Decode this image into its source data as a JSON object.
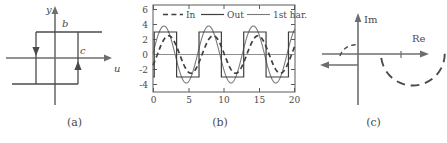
{
  "figure": {
    "panels": [
      {
        "id": "a",
        "caption": "(a)",
        "type": "hysteresis-relay-characteristic",
        "axis_labels": {
          "x": "u",
          "y": "y"
        },
        "point_labels": [
          "b",
          "c"
        ],
        "loop": {
          "x_switch_low": -1.0,
          "x_switch_high": 1.0,
          "y_high": 1.0,
          "y_low": -1.0,
          "direction": "clockwise"
        }
      },
      {
        "id": "b",
        "caption": "(b)",
        "type": "time-waveforms"
      },
      {
        "id": "c",
        "caption": "(c)",
        "type": "complex-plane-nyquist",
        "axis_labels": {
          "x": "Re",
          "y": "Im"
        },
        "arc": {
          "style": "dashed",
          "half": "lower",
          "radius": 1.0
        },
        "negative_real_ray": {
          "style": "solid",
          "arrow": "left"
        },
        "origin_arc": {
          "style": "dashed"
        }
      }
    ]
  },
  "chart_data": {
    "type": "line",
    "title": "",
    "xlabel": "",
    "ylabel": "",
    "xlim": [
      0,
      20
    ],
    "ylim": [
      -5,
      6.6
    ],
    "xticks": [
      0,
      5,
      10,
      15,
      20
    ],
    "yticks": [
      6,
      4,
      2,
      0,
      -2,
      -4
    ],
    "xtick_labels": [
      "0",
      "5",
      "10",
      "15",
      "20"
    ],
    "ytick_labels": [
      "6",
      "4",
      "2",
      "0",
      "-2",
      "-4"
    ],
    "grid": false,
    "legend_position": "top-inside",
    "legend": [
      {
        "label": "In",
        "style": "dashed",
        "color": "#3f3f3f"
      },
      {
        "label": "Out",
        "style": "solid",
        "color": "#3f3f3f"
      },
      {
        "label": "1st har.",
        "style": "solid",
        "color": "#7a7a7a"
      }
    ],
    "series": [
      {
        "name": "In",
        "style": "dashed",
        "color": "#3f3f3f",
        "waveform": "sine",
        "amplitude": 2.5,
        "period": 6.3,
        "phase_deg": -35,
        "offset": 0
      },
      {
        "name": "Out",
        "style": "solid",
        "color": "#3f3f3f",
        "waveform": "square",
        "amplitude": 3.0,
        "period": 6.3,
        "phase_deg": -10,
        "offset": 0
      },
      {
        "name": "1st har.",
        "style": "solid",
        "color": "#7a7a7a",
        "waveform": "sine",
        "amplitude": 3.8,
        "period": 6.3,
        "phase_deg": 2,
        "offset": 0
      }
    ]
  }
}
